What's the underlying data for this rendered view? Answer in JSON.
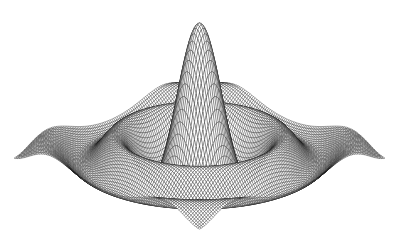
{
  "figure": {
    "background_color": "#ffffff",
    "mesh_color": "#1a1a1a",
    "face_color": "#ffffff",
    "header_clipped_text": "",
    "caption": ""
  },
  "chart_data": {
    "type": "surface",
    "render_style": "wireframe-mesh",
    "title": "",
    "subtitle": "",
    "xlabel": "",
    "ylabel": "",
    "zlabel": "",
    "function": "sombrero / sinc: z = sin(r)/r",
    "function_expression": "z = sin(sqrt(x^2 + y^2)) / sqrt(x^2 + y^2)",
    "radially_symmetric": true,
    "xlim": [
      -12,
      12
    ],
    "ylim": [
      -12,
      12
    ],
    "zlim": [
      -0.25,
      1.0
    ],
    "grid": false,
    "axes_visible": false,
    "legend": null,
    "colorbar": false,
    "grid_resolution": {
      "nx": 110,
      "ny": 110
    },
    "peak": {
      "x": 0,
      "y": 0,
      "z": 1.0,
      "screen_x": 197,
      "screen_y": 22
    },
    "ripple_rings": [
      {
        "ring": 1,
        "radius": 4.49,
        "z": -0.217,
        "type": "trough"
      },
      {
        "ring": 2,
        "radius": 7.73,
        "z": 0.128,
        "type": "crest"
      },
      {
        "ring": 3,
        "radius": 10.9,
        "z": -0.091,
        "type": "trough"
      }
    ],
    "view": {
      "azimuth_deg": -60,
      "elevation_deg": 22,
      "projection": "isometric",
      "base_corners": {
        "left": [
          14,
          150
        ],
        "right": [
          385,
          152
        ],
        "front": [
          200,
          222
        ],
        "back": [
          200,
          82
        ]
      }
    }
  }
}
